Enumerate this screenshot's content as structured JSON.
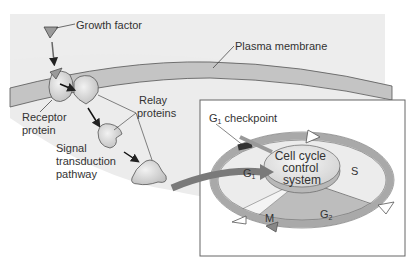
{
  "diagram": {
    "labels": {
      "growth_factor": "Growth factor",
      "plasma_membrane": "Plasma membrane",
      "receptor_line1": "Receptor",
      "receptor_line2": "protein",
      "relay_line1": "Relay",
      "relay_line2": "proteins",
      "signal_line1": "Signal",
      "signal_line2": "transduction",
      "signal_line3": "pathway",
      "checkpoint_main": "G",
      "checkpoint_sub": "1",
      "checkpoint_rest": " checkpoint",
      "control_line1": "Cell cycle",
      "control_line2": "control",
      "control_line3": "system"
    },
    "phases": {
      "g1_main": "G",
      "g1_sub": "1",
      "s": "S",
      "g2_main": "G",
      "g2_sub": "2",
      "m": "M"
    },
    "colors": {
      "background": "#ededed",
      "membrane": "#c4c4c4",
      "protein": "#d6d6d6",
      "ring": "#a9a9a9",
      "g2_sector": "#b9b9b9",
      "big_arrow": "#7a7a7a",
      "panel": "#ffffff"
    }
  }
}
